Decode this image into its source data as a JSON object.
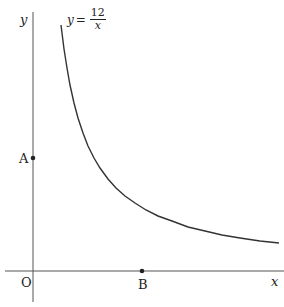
{
  "diagram": {
    "equation": {
      "lhs": "y",
      "equals": "=",
      "numerator": "12",
      "denominator": "x"
    },
    "axes": {
      "x_label": "x",
      "y_label": "y",
      "origin_label": "O"
    },
    "points": [
      {
        "label": "A",
        "on": "y-axis"
      },
      {
        "label": "B",
        "on": "x-axis"
      }
    ],
    "colors": {
      "stroke": "#333333",
      "text": "#222222"
    }
  }
}
